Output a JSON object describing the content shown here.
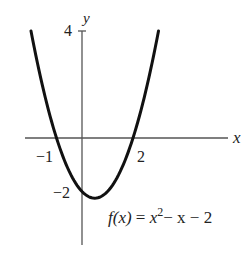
{
  "chart_data": {
    "type": "line",
    "title": "",
    "function_label": "f(x) = x² − x − 2",
    "function_label_parts": {
      "lhs": "f(x)",
      "eq": "=",
      "rhs_x": "x",
      "rhs_exp": "2",
      "rhs_rest": "− x − 2"
    },
    "xlabel": "x",
    "ylabel": "y",
    "x_tick_labels": [
      {
        "value": -1,
        "label": "−1"
      },
      {
        "value": 2,
        "label": "2"
      }
    ],
    "y_tick_labels": [
      {
        "value": 4,
        "label": "4"
      },
      {
        "value": -2,
        "label": "−2"
      }
    ],
    "xlim": [
      -2.2,
      6.5
    ],
    "ylim": [
      -4.0,
      4.0
    ],
    "grid": false,
    "series": [
      {
        "name": "f(x) = x^2 - x - 2",
        "x": [
          -2,
          -1.5,
          -1,
          -0.5,
          0,
          0.5,
          1,
          1.5,
          2,
          2.5,
          3
        ],
        "values": [
          4,
          1.75,
          0,
          -1.25,
          -2,
          -2.25,
          -2,
          -1.25,
          0,
          1.75,
          4
        ]
      }
    ],
    "key_points": {
      "x_intercepts": [
        -1,
        2
      ],
      "y_intercept": -2,
      "vertex": [
        0.5,
        -2.25
      ]
    }
  }
}
